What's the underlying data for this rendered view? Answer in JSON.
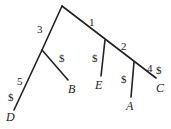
{
  "diagram": {
    "type": "tree",
    "edge_color": "#222222",
    "nodes": {
      "root": {
        "x": 62,
        "y": 6
      },
      "n3": {
        "x": 42,
        "y": 50
      },
      "n1": {
        "x": 105,
        "y": 40
      },
      "n2": {
        "x": 134,
        "y": 62
      }
    },
    "leaves": {
      "D": "D",
      "B": "B",
      "E": "E",
      "A": "A",
      "C": "C"
    },
    "edge_labels": {
      "root_n3": "3",
      "root_n1": "1",
      "n1_n2": "2",
      "n2_C": "4",
      "n3_D_upper": "5",
      "n3_D_lower": "$",
      "n3_B": "$",
      "n1_E": "$",
      "n2_A": "$",
      "n2_C_end": "$"
    }
  }
}
